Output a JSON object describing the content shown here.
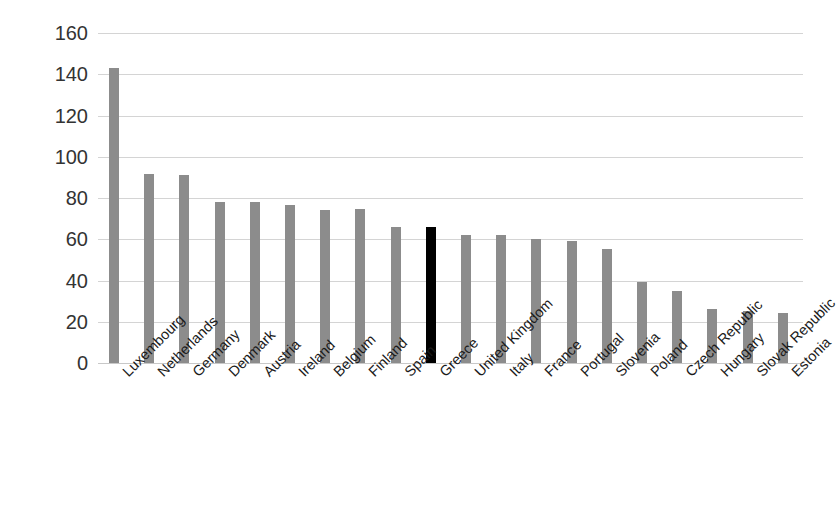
{
  "chart_data": {
    "type": "bar",
    "title": "",
    "subtitle": "",
    "xlabel": "",
    "ylabel": "",
    "ylim": [
      0,
      160
    ],
    "ytick_step": 20,
    "yticks": [
      160,
      140,
      120,
      100,
      80,
      60,
      40,
      20,
      0
    ],
    "grid": true,
    "legend": false,
    "legend_position": "none",
    "categories": [
      "Luxembourg",
      "Netherlands",
      "Germany",
      "Denmark",
      "Austria",
      "Ireland",
      "Belgium",
      "Finland",
      "Spain",
      "Greece",
      "United Kingdom",
      "Italy",
      "France",
      "Portugal",
      "Slovenia",
      "Poland",
      "Czech Republic",
      "Hungary",
      "Slovak Republic",
      "Estonia"
    ],
    "values": [
      143,
      91.5,
      91,
      78,
      78,
      76.5,
      74,
      74.5,
      66,
      66,
      62,
      62,
      60,
      59,
      55.5,
      39.5,
      35,
      26,
      25,
      24
    ],
    "highlight_category": "Greece",
    "colors": {
      "bar": "#8c8c8c",
      "bar_highlight": "#000000",
      "gridline": "#d4d4d4",
      "axis_text": "#333333",
      "background": "#ffffff"
    }
  }
}
